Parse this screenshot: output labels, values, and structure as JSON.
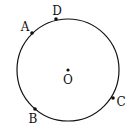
{
  "diagram": {
    "type": "circle-with-points",
    "circle": {
      "cx": 68,
      "cy": 70,
      "r": 51
    },
    "center": {
      "label": "O",
      "x": 68,
      "y": 70,
      "label_x": 68,
      "label_y": 84
    },
    "points": [
      {
        "label": "D",
        "x": 56,
        "y": 19,
        "label_x": 57,
        "label_y": 15
      },
      {
        "label": "A",
        "x": 32,
        "y": 33,
        "label_x": 25,
        "label_y": 31
      },
      {
        "label": "B",
        "x": 35,
        "y": 109,
        "label_x": 33,
        "label_y": 123
      },
      {
        "label": "C",
        "x": 113,
        "y": 98,
        "label_x": 121,
        "label_y": 106
      }
    ],
    "colors": {
      "stroke": "#111111",
      "background": "#ffffff"
    }
  }
}
